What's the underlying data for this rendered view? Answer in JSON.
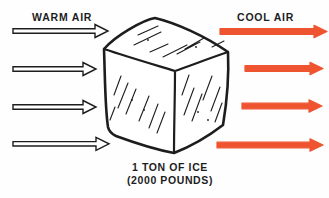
{
  "labels": {
    "warm_air": "WARM AIR",
    "cool_air": "COOL AIR"
  },
  "caption": {
    "line1": "1 TON OF ICE",
    "line2": "(2000 POUNDS)"
  },
  "colors": {
    "background": "#fefefe",
    "ink": "#1d1d1d",
    "cool_arrow": "#ef5430",
    "warm_arrow_fill": "#ffffff"
  },
  "arrows": {
    "warm": {
      "count": 4,
      "direction": "right",
      "style": "outlined"
    },
    "cool": {
      "count": 4,
      "direction": "right",
      "style": "solid"
    }
  }
}
